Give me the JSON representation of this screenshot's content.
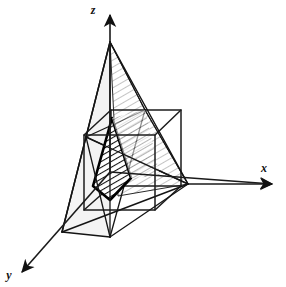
{
  "figure": {
    "background_color": "#ffffff",
    "line_color": "#1a1a1a",
    "hatch_color_dark": "#111111",
    "hatch_color_light": "#8a8a8a",
    "shade_fill": "#f0f0f0"
  },
  "axes": {
    "z": {
      "label": "z",
      "label_x": 93,
      "label_y": 14,
      "direction": "up",
      "arrowhead": true
    },
    "x": {
      "label": "x",
      "label_x": 264,
      "label_y": 172,
      "direction": "right",
      "arrowhead": true
    },
    "y": {
      "label": "y",
      "label_x": 9,
      "label_y": 279,
      "direction": "down-left",
      "arrowhead": true
    }
  },
  "geometry": {
    "origin": {
      "x": 110,
      "y": 172
    },
    "octahedron_vertices": {
      "top": {
        "x": 110,
        "y": 42
      },
      "bottom": {
        "x": 110,
        "y": 237
      },
      "left": {
        "x": 86,
        "y": 137
      },
      "right": {
        "x": 188,
        "y": 184
      },
      "front": {
        "x": 62,
        "y": 232
      },
      "back": {
        "x": 145,
        "y": 110
      }
    },
    "cube": {
      "front_top_left": {
        "x": 84,
        "y": 135
      },
      "front_top_right": {
        "x": 155,
        "y": 135
      },
      "front_bottom_left": {
        "x": 84,
        "y": 210
      },
      "front_bottom_right": {
        "x": 155,
        "y": 210
      },
      "back_top_left": {
        "x": 111,
        "y": 110
      },
      "back_top_right": {
        "x": 181,
        "y": 110
      },
      "back_bottom_left": {
        "x": 111,
        "y": 186
      },
      "back_bottom_right": {
        "x": 181,
        "y": 186
      }
    }
  },
  "planes": [
    {
      "name": "front-hatched-plane",
      "style": "dark-bold-hatched",
      "description": "bold-outlined dark hatched triangular face at front-centre"
    },
    {
      "name": "rear-hatched-plane",
      "style": "light-hatched",
      "description": "lighter hatched quadrilateral plane behind, slanting to lower right"
    },
    {
      "name": "left-shaded-face",
      "style": "light-grey-fill",
      "description": "pale grey octahedron face on the lower left"
    }
  ]
}
